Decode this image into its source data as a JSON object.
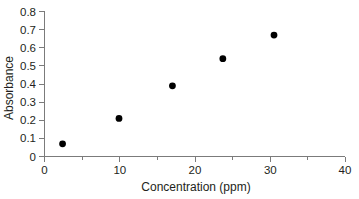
{
  "chart_data": {
    "type": "scatter",
    "title": "",
    "xlabel": "Concentration (ppm)",
    "ylabel": "Absorbance",
    "xlim": [
      0,
      40
    ],
    "ylim": [
      0,
      0.8
    ],
    "grid": false,
    "legend": "none",
    "marker": "filled-circle",
    "marker_color": "#000000",
    "x_ticks": [
      0,
      10,
      20,
      30,
      40
    ],
    "x_tick_labels": [
      "0",
      "10",
      "20",
      "30",
      "40"
    ],
    "x_minor_ticks": [
      5,
      15,
      25,
      35
    ],
    "y_ticks": [
      0,
      0.1,
      0.2,
      0.3,
      0.4,
      0.5,
      0.6,
      0.7,
      0.8
    ],
    "y_tick_labels": [
      "0",
      "0.1",
      "0.2",
      "0.3",
      "0.4",
      "0.5",
      "0.6",
      "0.7",
      "0.8"
    ],
    "points": [
      {
        "x": 2.4,
        "y": 0.07
      },
      {
        "x": 9.9,
        "y": 0.21
      },
      {
        "x": 17.0,
        "y": 0.39
      },
      {
        "x": 23.7,
        "y": 0.54
      },
      {
        "x": 30.5,
        "y": 0.67
      }
    ],
    "x": [
      2.4,
      9.9,
      17.0,
      23.7,
      30.5
    ],
    "values": [
      0.07,
      0.21,
      0.39,
      0.54,
      0.67
    ],
    "axis_color": "#7b7b7b",
    "text_color": "#231f20"
  },
  "caption": {
    "text": ""
  }
}
